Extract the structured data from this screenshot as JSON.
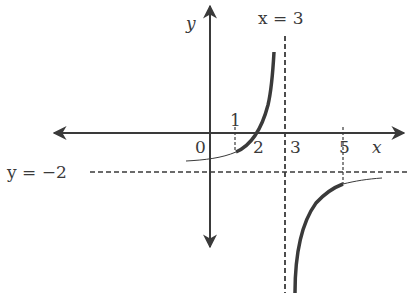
{
  "diagram": {
    "type": "function-graph",
    "labels": {
      "y_axis": "y",
      "x_axis": "x",
      "vertical_asymptote": "x = 3",
      "horizontal_asymptote": "y = −2",
      "origin": "0",
      "tick_1": "1",
      "tick_2": "2",
      "tick_3": "3",
      "tick_5": "5"
    },
    "asymptotes": {
      "vertical": {
        "x": 3
      },
      "horizontal": {
        "y": -2
      }
    },
    "curves": [
      {
        "name": "left-branch-highlighted",
        "domain": [
          1,
          2.8
        ],
        "style": "thick"
      },
      {
        "name": "left-branch-thin",
        "domain": [
          -1,
          1
        ],
        "style": "thin"
      },
      {
        "name": "right-branch-highlighted",
        "domain": [
          3.2,
          5
        ],
        "style": "thick"
      },
      {
        "name": "right-branch-thin",
        "domain": [
          5,
          7
        ],
        "style": "thin"
      }
    ],
    "colors": {
      "stroke": "#3a3a3a",
      "background": "#ffffff"
    }
  }
}
